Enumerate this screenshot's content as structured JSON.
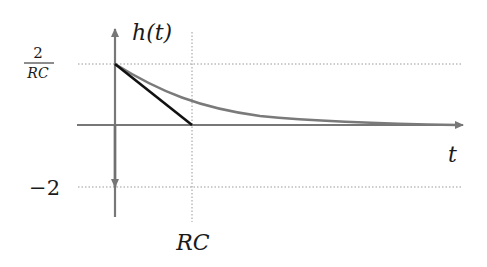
{
  "diagram": {
    "y_axis_label": "h(t)",
    "x_axis_label": "t",
    "y_tick_top": {
      "numerator": "2",
      "denominator": "RC"
    },
    "y_tick_bottom": "−2",
    "x_tick": "RC",
    "curves": [
      {
        "name": "exponential-decay",
        "description": "(2/RC) e^{-t/RC} for t>0",
        "color": "#7a7a7a"
      },
      {
        "name": "tangent-line",
        "description": "initial slope tangent reaching zero at t=RC",
        "color": "#111111"
      },
      {
        "name": "impulse",
        "description": "-2 δ(t) downward arrow at t=0",
        "color": "#707070"
      }
    ],
    "colors": {
      "axes": "#777777",
      "grid": "#999999",
      "curve": "#7a7a7a",
      "tangent": "#111111",
      "text": "#1a1a1a"
    }
  }
}
